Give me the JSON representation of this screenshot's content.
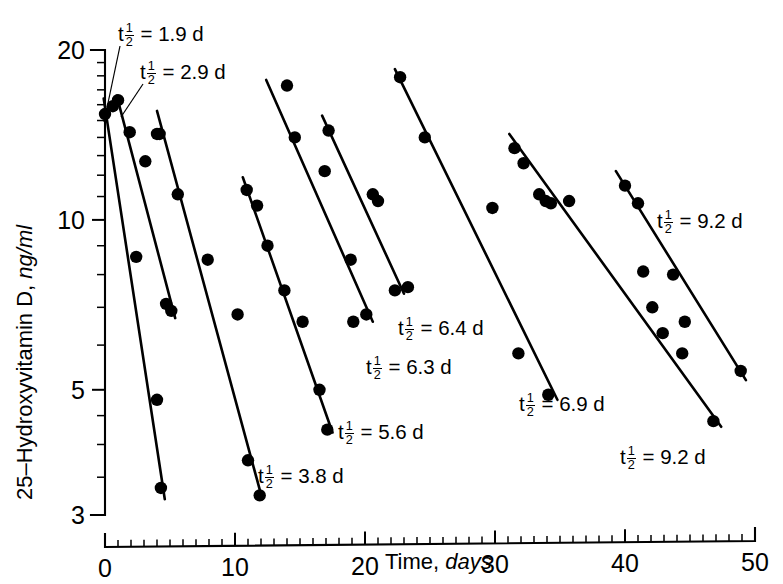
{
  "chart_data": {
    "type": "scatter",
    "title": "",
    "xlabel": "Time, days",
    "ylabel": "25–Hydroxyvitamin D, ng/ml",
    "xlabel_plain": "Time,",
    "xlabel_italic": "days",
    "ylabel_plain": "25–Hydroxyvitamin D,",
    "ylabel_italic": "ng/ml",
    "xlim": [
      0,
      50
    ],
    "ylim": [
      3,
      20
    ],
    "yscale": "log",
    "xscale": "linear",
    "grid": false,
    "legend_position": "none",
    "x_ticks_major": [
      0,
      10,
      20,
      30,
      40,
      50
    ],
    "x_tick_labels": [
      "0",
      "10",
      "20",
      "30",
      "40",
      "50"
    ],
    "x_ticks_minor": [
      1,
      2,
      3,
      4,
      5,
      6,
      7,
      8,
      9,
      11,
      12,
      13,
      14,
      15,
      16,
      17,
      18,
      19,
      21,
      22,
      23,
      24,
      25,
      26,
      27,
      28,
      29,
      31,
      32,
      33,
      34,
      35,
      36,
      37,
      38,
      39,
      41,
      42,
      43,
      44,
      45,
      46,
      47,
      48,
      49
    ],
    "y_ticks_major": [
      3,
      5,
      10,
      20
    ],
    "y_tick_labels": [
      "3",
      "5",
      "10",
      "20"
    ],
    "y_ticks_minor": [
      3.5,
      4,
      4.5,
      6,
      7,
      8,
      9,
      11,
      12,
      13,
      14,
      15,
      16,
      17,
      18,
      19
    ],
    "series": [
      {
        "name": "subject-1",
        "half_life_days": 1.9,
        "annotation": "t½ = 1.9 d",
        "annotation_value": "1.9",
        "points": [
          {
            "x": 0.0,
            "y": 15.4
          },
          {
            "x": 0.6,
            "y": 15.9
          },
          {
            "x": 2.4,
            "y": 8.6
          },
          {
            "x": 4.0,
            "y": 4.8
          },
          {
            "x": 4.3,
            "y": 3.35
          }
        ],
        "line": [
          {
            "x": -0.1,
            "y": 16.4
          },
          {
            "x": 4.6,
            "y": 3.2
          }
        ]
      },
      {
        "name": "subject-2",
        "half_life_days": 2.9,
        "annotation": "t½ = 2.9 d",
        "annotation_value": "2.9",
        "points": [
          {
            "x": 1.0,
            "y": 16.3
          },
          {
            "x": 1.9,
            "y": 14.3
          },
          {
            "x": 3.1,
            "y": 12.7
          },
          {
            "x": 4.0,
            "y": 14.2
          },
          {
            "x": 4.7,
            "y": 7.1
          },
          {
            "x": 5.1,
            "y": 6.9
          }
        ],
        "line": [
          {
            "x": 0.9,
            "y": 16.6
          },
          {
            "x": 5.4,
            "y": 6.7
          }
        ]
      },
      {
        "name": "subject-3",
        "half_life_days": 3.8,
        "annotation": "t½ = 3.8 d",
        "annotation_value": "3.8",
        "points": [
          {
            "x": 4.2,
            "y": 14.2
          },
          {
            "x": 5.6,
            "y": 11.1
          },
          {
            "x": 7.9,
            "y": 8.5
          },
          {
            "x": 10.2,
            "y": 6.8
          },
          {
            "x": 11.0,
            "y": 3.75
          },
          {
            "x": 11.9,
            "y": 3.25
          }
        ],
        "line": [
          {
            "x": 4.0,
            "y": 15.6
          },
          {
            "x": 12.1,
            "y": 3.2
          }
        ]
      },
      {
        "name": "subject-4",
        "half_life_days": 5.6,
        "annotation": "t½ = 5.6 d",
        "annotation_value": "5.6",
        "points": [
          {
            "x": 10.9,
            "y": 11.3
          },
          {
            "x": 11.7,
            "y": 10.6
          },
          {
            "x": 12.5,
            "y": 9.0
          },
          {
            "x": 13.8,
            "y": 7.5
          },
          {
            "x": 15.2,
            "y": 6.6
          },
          {
            "x": 16.5,
            "y": 5.0
          },
          {
            "x": 17.1,
            "y": 4.25
          }
        ],
        "line": [
          {
            "x": 10.6,
            "y": 11.9
          },
          {
            "x": 17.5,
            "y": 4.2
          }
        ]
      },
      {
        "name": "subject-5",
        "half_life_days": 6.3,
        "annotation": "t½ = 6.3 d",
        "annotation_value": "6.3",
        "points": [
          {
            "x": 14.0,
            "y": 17.3
          },
          {
            "x": 14.6,
            "y": 14.0
          },
          {
            "x": 16.9,
            "y": 12.2
          },
          {
            "x": 18.9,
            "y": 8.5
          },
          {
            "x": 19.1,
            "y": 6.6
          },
          {
            "x": 20.1,
            "y": 6.8
          }
        ],
        "line": [
          {
            "x": 12.4,
            "y": 17.7
          },
          {
            "x": 20.6,
            "y": 6.6
          }
        ]
      },
      {
        "name": "subject-6",
        "half_life_days": 6.4,
        "annotation": "t½ = 6.4 d",
        "annotation_value": "6.4",
        "points": [
          {
            "x": 17.2,
            "y": 14.4
          },
          {
            "x": 20.6,
            "y": 11.1
          },
          {
            "x": 21.0,
            "y": 10.8
          },
          {
            "x": 22.3,
            "y": 7.5
          },
          {
            "x": 23.3,
            "y": 7.6
          }
        ],
        "line": [
          {
            "x": 16.7,
            "y": 15.3
          },
          {
            "x": 23.0,
            "y": 7.4
          }
        ]
      },
      {
        "name": "subject-7",
        "half_life_days": 6.9,
        "annotation": "t½ = 6.9 d",
        "annotation_value": "6.9",
        "points": [
          {
            "x": 22.7,
            "y": 17.9
          },
          {
            "x": 24.6,
            "y": 14.0
          },
          {
            "x": 29.8,
            "y": 10.5
          },
          {
            "x": 31.8,
            "y": 5.8
          },
          {
            "x": 34.1,
            "y": 4.9
          }
        ],
        "line": [
          {
            "x": 22.3,
            "y": 18.5
          },
          {
            "x": 34.8,
            "y": 4.8
          }
        ]
      },
      {
        "name": "subject-8",
        "half_life_days": 9.2,
        "annotation": "t½ = 9.2 d",
        "annotation_value": "9.2",
        "points": [
          {
            "x": 31.5,
            "y": 13.4
          },
          {
            "x": 32.2,
            "y": 12.6
          },
          {
            "x": 33.4,
            "y": 11.1
          },
          {
            "x": 33.9,
            "y": 10.8
          },
          {
            "x": 34.3,
            "y": 10.7
          },
          {
            "x": 35.7,
            "y": 10.8
          },
          {
            "x": 41.4,
            "y": 8.1
          },
          {
            "x": 42.1,
            "y": 7.0
          },
          {
            "x": 42.9,
            "y": 6.3
          },
          {
            "x": 44.4,
            "y": 5.8
          },
          {
            "x": 46.8,
            "y": 4.4
          }
        ],
        "line": [
          {
            "x": 31.1,
            "y": 14.2
          },
          {
            "x": 47.4,
            "y": 4.3
          }
        ]
      },
      {
        "name": "subject-9",
        "half_life_days": 9.2,
        "annotation": "t½ = 9.2 d",
        "annotation_value": "9.2",
        "points": [
          {
            "x": 40.0,
            "y": 11.5
          },
          {
            "x": 41.0,
            "y": 10.7
          },
          {
            "x": 43.7,
            "y": 8.0
          },
          {
            "x": 44.6,
            "y": 6.6
          },
          {
            "x": 48.9,
            "y": 5.4
          }
        ],
        "line": [
          {
            "x": 39.3,
            "y": 12.2
          },
          {
            "x": 49.3,
            "y": 5.2
          }
        ]
      }
    ],
    "annotations": [
      {
        "id": "annot-1",
        "label_prefix": "t",
        "fraction": "1/2",
        "equals": "=",
        "value": "1.9",
        "unit": "d",
        "x_px": 118,
        "y_px": 22,
        "has_leader": true,
        "leader_from_px": [
          120,
          46
        ],
        "leader_to_px": [
          104,
          122
        ]
      },
      {
        "id": "annot-2",
        "label_prefix": "t",
        "fraction": "1/2",
        "equals": "=",
        "value": "2.9",
        "unit": "d",
        "x_px": 140,
        "y_px": 60,
        "has_leader": true,
        "leader_from_px": [
          143,
          84
        ],
        "leader_to_px": [
          121,
          117
        ]
      },
      {
        "id": "annot-3",
        "label_prefix": "t",
        "fraction": "1/2",
        "equals": "=",
        "value": "3.8",
        "unit": "d",
        "x_px": 258,
        "y_px": 464,
        "has_leader": false
      },
      {
        "id": "annot-4",
        "label_prefix": "t",
        "fraction": "1/2",
        "equals": "=",
        "value": "5.6",
        "unit": "d",
        "x_px": 338,
        "y_px": 420,
        "has_leader": false
      },
      {
        "id": "annot-5",
        "label_prefix": "t",
        "fraction": "1/2",
        "equals": "=",
        "value": "6.3",
        "unit": "d",
        "x_px": 366,
        "y_px": 355,
        "has_leader": false
      },
      {
        "id": "annot-6",
        "label_prefix": "t",
        "fraction": "1/2",
        "equals": "=",
        "value": "6.4",
        "unit": "d",
        "x_px": 398,
        "y_px": 316,
        "has_leader": false
      },
      {
        "id": "annot-7",
        "label_prefix": "t",
        "fraction": "1/2",
        "equals": "=",
        "value": "6.9",
        "unit": "d",
        "x_px": 519,
        "y_px": 392,
        "has_leader": false
      },
      {
        "id": "annot-8",
        "label_prefix": "t",
        "fraction": "1/2",
        "equals": "=",
        "value": "9.2",
        "unit": "d",
        "x_px": 657,
        "y_px": 209,
        "has_leader": false
      },
      {
        "id": "annot-9",
        "label_prefix": "t",
        "fraction": "1/2",
        "equals": "=",
        "value": "9.2",
        "unit": "d",
        "x_px": 620,
        "y_px": 445,
        "has_leader": false
      }
    ]
  },
  "colors": {
    "ink": "#000000",
    "background": "#ffffff"
  }
}
